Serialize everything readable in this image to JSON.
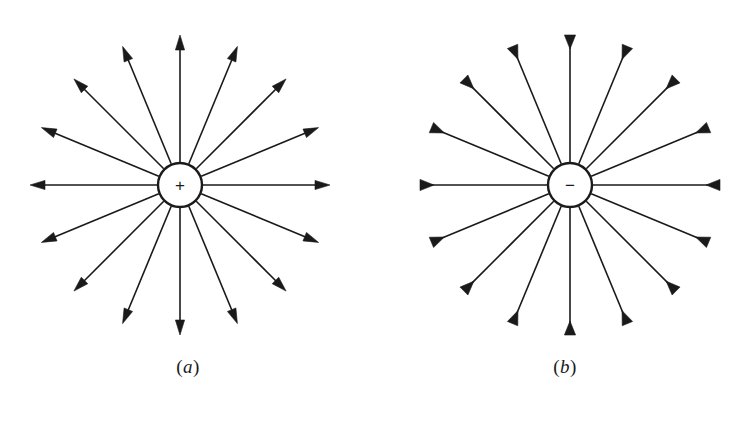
{
  "figure": {
    "background_color": "#ffffff",
    "line_color": "#1a1a1a",
    "width": 753,
    "height": 439
  },
  "panels": [
    {
      "id": "a",
      "caption": "(a)",
      "caption_open_paren": "(",
      "caption_letter": "a",
      "caption_close_paren": ")",
      "charge_sign": "+",
      "charge_polarity": "positive",
      "field_direction": "outward",
      "center_x": 180,
      "center_y": 185,
      "circle_radius": 22,
      "ray_count": 16,
      "ray_angle_step_deg": 22.5,
      "ray_length": 150,
      "stroke_width": 1.6,
      "circle_stroke_width": 2.4
    },
    {
      "id": "b",
      "caption": "(b)",
      "caption_open_paren": "(",
      "caption_letter": "b",
      "caption_close_paren": ")",
      "charge_sign": "−",
      "charge_polarity": "negative",
      "field_direction": "inward",
      "center_x": 193,
      "center_y": 185,
      "circle_radius": 22,
      "ray_count": 16,
      "ray_angle_step_deg": 22.5,
      "ray_length": 150,
      "stroke_width": 1.6,
      "circle_stroke_width": 2.4
    }
  ],
  "chart_data": {
    "type": "diagram",
    "panels": [
      {
        "label": "(a)",
        "charge": "+",
        "lines": 16,
        "angles_deg": [
          0,
          22.5,
          45,
          67.5,
          90,
          112.5,
          135,
          157.5,
          180,
          202.5,
          225,
          247.5,
          270,
          292.5,
          315,
          337.5
        ],
        "arrow_direction": "outward",
        "inner_radius": 22,
        "outer_radius": 150
      },
      {
        "label": "(b)",
        "charge": "−",
        "lines": 16,
        "angles_deg": [
          0,
          22.5,
          45,
          67.5,
          90,
          112.5,
          135,
          157.5,
          180,
          202.5,
          225,
          247.5,
          270,
          292.5,
          315,
          337.5
        ],
        "arrow_direction": "inward",
        "inner_radius": 22,
        "outer_radius": 150
      }
    ]
  }
}
